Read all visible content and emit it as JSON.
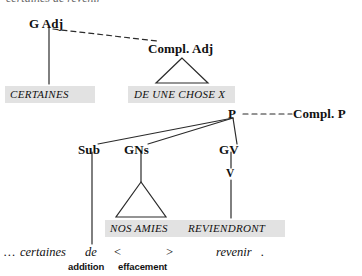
{
  "figure": {
    "type": "syntactic-tree-diagram",
    "language": "fr",
    "cutoff_caption": "certaines de revenir"
  },
  "colors": {
    "ink": "#111111",
    "line": "#2b2b2b",
    "highlight_band": "#e2e2e2",
    "background": "#ffffff"
  },
  "nodes": {
    "g_adj": "G Adj",
    "compl_adj": "Compl. Adj",
    "compl_p": "Compl. P",
    "p": "P",
    "sub": "Sub",
    "gns": "GNs",
    "gv": "GV",
    "v": "V"
  },
  "terminals": {
    "certaines": "CERTAINES",
    "de_une_chose_x": "DE UNE CHOSE X",
    "nos_amies": "NOS AMIES",
    "reviendront": "REVIENDRONT"
  },
  "surface": {
    "ellipsis": "…",
    "certaines": "certaines",
    "de": "de",
    "bracket_open": "<",
    "bracket_close": ">",
    "revenir": "revenir",
    "period": "."
  },
  "operations": {
    "addition": "addition",
    "effacement": "effacement"
  }
}
